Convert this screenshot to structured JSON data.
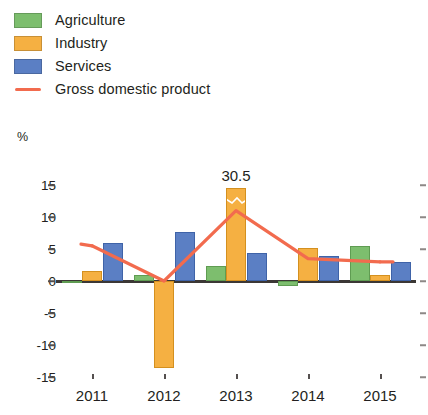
{
  "legend": {
    "items": [
      {
        "label": "Agriculture",
        "type": "swatch",
        "color": "#7DBE6E",
        "icon": "color-swatch"
      },
      {
        "label": "Industry",
        "type": "swatch",
        "color": "#F5B042",
        "icon": "color-swatch"
      },
      {
        "label": "Services",
        "type": "swatch",
        "color": "#5B7FC4",
        "icon": "color-swatch"
      },
      {
        "label": "Gross domestic product",
        "type": "line",
        "color": "#F26B4E",
        "icon": "line-marker"
      }
    ]
  },
  "axis": {
    "y_unit": "%",
    "y_ticks": [
      "15",
      "10",
      "5",
      "0",
      "-5",
      "-10",
      "-15"
    ],
    "x_ticks": [
      "2011",
      "2012",
      "2013",
      "2014",
      "2015"
    ]
  },
  "annotations": [
    {
      "text": "30.5",
      "series": "Industry",
      "category": "2013"
    }
  ],
  "chart_data": {
    "type": "bar",
    "title": "",
    "subtitle": "",
    "xlabel": "",
    "ylabel": "%",
    "ylim": [
      -15,
      15
    ],
    "ytick_values": [
      15,
      10,
      5,
      0,
      -5,
      -10,
      -15
    ],
    "grid": false,
    "legend_position": "top-left",
    "categories": [
      "2011",
      "2012",
      "2013",
      "2014",
      "2015"
    ],
    "series": [
      {
        "name": "Agriculture",
        "color": "#7DBE6E",
        "type": "bar",
        "values": [
          -0.1,
          1.0,
          2.3,
          -0.8,
          5.5
        ]
      },
      {
        "name": "Industry",
        "color": "#F5B042",
        "type": "bar",
        "values": [
          1.6,
          -13.6,
          30.5,
          5.1,
          1.0
        ],
        "clipped": {
          "2013": {
            "displayed_to": 14.5,
            "actual": 30.5,
            "axis_break": true
          }
        }
      },
      {
        "name": "Services",
        "color": "#5B7FC4",
        "type": "bar",
        "values": [
          5.9,
          7.6,
          4.4,
          3.9,
          3.0
        ]
      },
      {
        "name": "Gross domestic product",
        "color": "#F26B4E",
        "type": "line",
        "values": [
          5.5,
          0.0,
          11.0,
          3.5,
          3.0
        ]
      }
    ]
  }
}
